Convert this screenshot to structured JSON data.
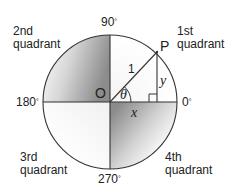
{
  "diagram": {
    "type": "unit-circle",
    "center_label": "O",
    "point_label": "P",
    "radius_label": "1",
    "angle_label": "θ",
    "x_label": "x",
    "y_label": "y",
    "degree_symbol": "°",
    "angles": {
      "top": "90",
      "left": "180",
      "right": "0",
      "bottom": "270"
    },
    "quadrants": {
      "first": {
        "line1": "1st",
        "line2": "quadrant"
      },
      "second": {
        "line1": "2nd",
        "line2": "quadrant"
      },
      "third": {
        "line1": "3rd",
        "line2": "quadrant"
      },
      "fourth": {
        "line1": "4th",
        "line2": "quadrant"
      }
    },
    "colors": {
      "line": "#333333",
      "shade_dark": "#8a8a8a",
      "shade_light": "#ffffff"
    }
  }
}
